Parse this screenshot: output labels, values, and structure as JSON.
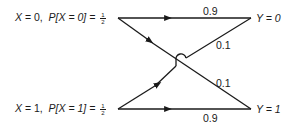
{
  "inputs": [
    {
      "var": "X",
      "value": "0",
      "prob_label": "P[X = 0] =",
      "prob_num": "1",
      "prob_den": "2"
    },
    {
      "var": "X",
      "value": "1",
      "prob_label": "P[X = 1] =",
      "prob_num": "1",
      "prob_den": "2"
    }
  ],
  "outputs": [
    {
      "label": "Y = 0"
    },
    {
      "label": "Y = 1"
    }
  ],
  "transitions": {
    "x0_to_y0": "0.9",
    "x0_to_y1": "0.1",
    "x1_to_y0": "0.1",
    "x1_to_y1": "0.9"
  },
  "colors": {
    "line": "#1a1a1a",
    "background": "#ffffff"
  }
}
